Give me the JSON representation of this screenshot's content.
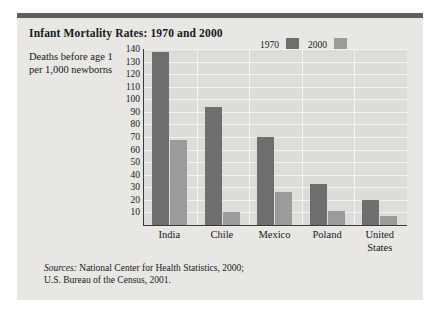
{
  "figure": {
    "title": "Infant Mortality Rates: 1970 and 2000",
    "axis_label": "Deaths before age 1 per 1,000 newborns",
    "sources_lead": "Sources:",
    "sources_line1": " National Center for Health Statistics, 2000;",
    "sources_line2": "U.S. Bureau of the Census, 2001."
  },
  "colors": {
    "panel": "#e8e7e4",
    "plot": "#dddcd8",
    "top_rule": "#5e5e5e",
    "series_1970": "#6e6e6e",
    "series_2000": "#9b9b9b",
    "axis": "#3a3a3a",
    "gridline": "#f4f3f1",
    "text": "#16181d"
  },
  "chart_data": {
    "type": "bar",
    "title": "Infant Mortality Rates: 1970 and 2000",
    "xlabel": "",
    "ylabel": "Deaths before age 1 per 1,000 newborns",
    "ylim": [
      0,
      140
    ],
    "ytick_step": 10,
    "yticks": [
      140,
      130,
      120,
      110,
      100,
      90,
      80,
      70,
      60,
      50,
      40,
      30,
      20,
      10
    ],
    "grid": true,
    "legend_position": "top-right",
    "categories": [
      "India",
      "Chile",
      "Mexico",
      "Poland",
      "United States"
    ],
    "category_lines": [
      [
        "India"
      ],
      [
        "Chile"
      ],
      [
        "Mexico"
      ],
      [
        "Poland"
      ],
      [
        "United",
        "States"
      ]
    ],
    "series": [
      {
        "name": "1970",
        "color": "#6e6e6e",
        "values": [
          138,
          94,
          70,
          33,
          20
        ]
      },
      {
        "name": "2000",
        "color": "#9b9b9b",
        "values": [
          68,
          10,
          26,
          11,
          7
        ]
      }
    ]
  }
}
